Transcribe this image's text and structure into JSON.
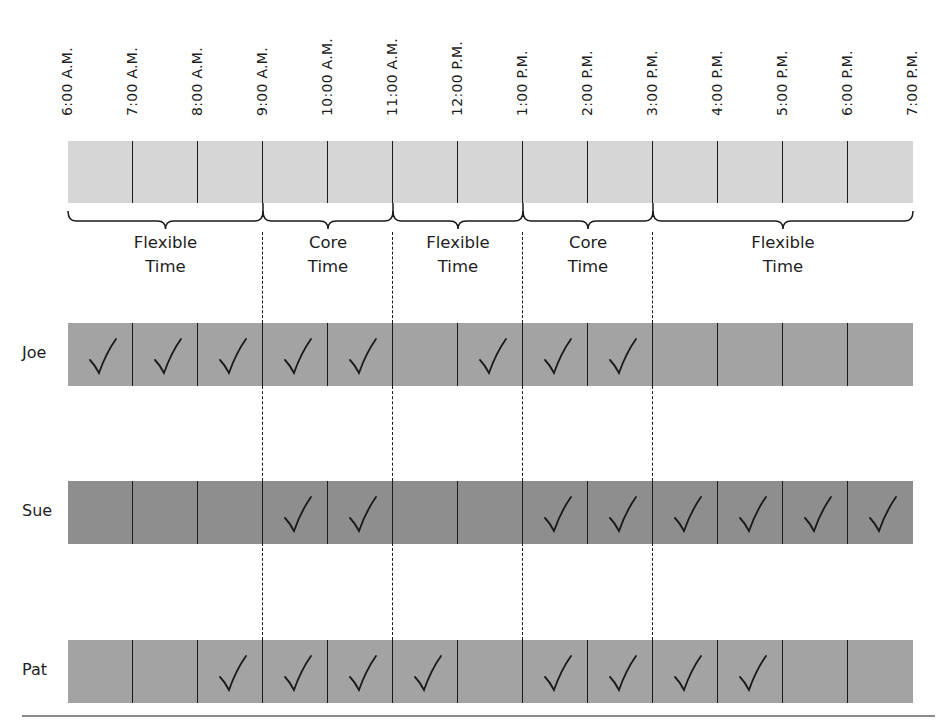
{
  "times": [
    "6:00 A.M.",
    "7:00 A.M.",
    "8:00 A.M.",
    "9:00 A.M.",
    "10:00 A.M.",
    "11:00 A.M.",
    "12:00 P.M.",
    "1:00 P.M.",
    "2:00 P.M.",
    "3:00 P.M.",
    "4:00 P.M.",
    "5:00 P.M.",
    "6:00 P.M.",
    "7:00 P.M."
  ],
  "segments": [
    {
      "line1": "Flexible",
      "line2": "Time",
      "start": 0,
      "end": 3
    },
    {
      "line1": "Core",
      "line2": "Time",
      "start": 3,
      "end": 5
    },
    {
      "line1": "Flexible",
      "line2": "Time",
      "start": 5,
      "end": 7
    },
    {
      "line1": "Core",
      "line2": "Time",
      "start": 7,
      "end": 9
    },
    {
      "line1": "Flexible",
      "line2": "Time",
      "start": 9,
      "end": 13
    }
  ],
  "rows": [
    {
      "name": "Joe",
      "color": "#a3a3a3",
      "checks": [
        1,
        1,
        1,
        1,
        1,
        0,
        1,
        1,
        1,
        0,
        0,
        0,
        0
      ]
    },
    {
      "name": "Sue",
      "color": "#8e8e8e",
      "checks": [
        0,
        0,
        0,
        1,
        1,
        0,
        0,
        1,
        1,
        1,
        1,
        1,
        1
      ]
    },
    {
      "name": "Pat",
      "color": "#a3a3a3",
      "checks": [
        0,
        0,
        1,
        1,
        1,
        1,
        0,
        1,
        1,
        1,
        1,
        0,
        0
      ]
    }
  ],
  "colors": {
    "timeline_bar": "#d6d6d6",
    "joe_row": "#a3a3a3",
    "sue_row": "#8e8e8e",
    "pat_row": "#a3a3a3",
    "lines": "#1a1a1a"
  }
}
